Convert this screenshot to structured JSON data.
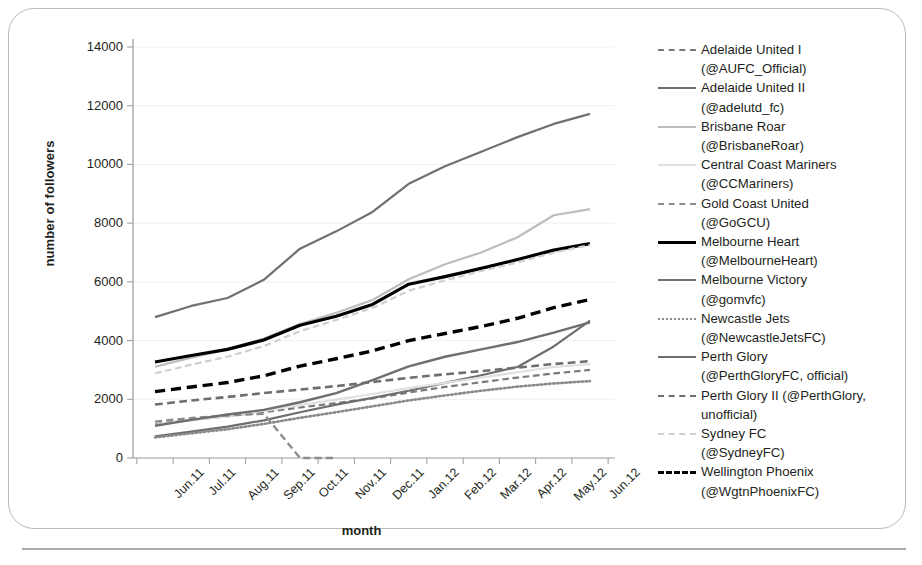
{
  "axes": {
    "ylabel": "number of followers",
    "xlabel": "month",
    "yticks": [
      "0",
      "2000",
      "4000",
      "6000",
      "8000",
      "10000",
      "12000",
      "14000"
    ],
    "xticks": [
      "Jun.11",
      "Jul.11",
      "Aug.11",
      "Sep.11",
      "Oct.11",
      "Nov.11",
      "Dec.11",
      "Jan.12",
      "Feb.12",
      "Mar.12",
      "Apr.12",
      "May.12",
      "Jun.12"
    ]
  },
  "legend": {
    "items": [
      {
        "name": "Adelaide United I",
        "handle": "(@AUFC_Official)",
        "color": "#7a7a7a",
        "dash": "dashed",
        "width": 2.2
      },
      {
        "name": "Adelaide United II",
        "handle": "(@adelutd_fc)",
        "color": "#6e6e6e",
        "dash": "solid",
        "width": 2.2
      },
      {
        "name": "Brisbane Roar",
        "handle": "(@BrisbaneRoar)",
        "color": "#bdbdbd",
        "dash": "solid",
        "width": 2.2
      },
      {
        "name": "Central Coast Mariners",
        "handle": "(@CCMariners)",
        "color": "#e0e0e0",
        "dash": "solid",
        "width": 2.2
      },
      {
        "name": "Gold Coast United",
        "handle": "(@GoGCU)",
        "color": "#8c8c8c",
        "dash": "dashed",
        "width": 2.4
      },
      {
        "name": "Melbourne Heart",
        "handle": "(@MelbourneHeart)",
        "color": "#000000",
        "dash": "solid",
        "width": 3.2
      },
      {
        "name": "Melbourne Victory",
        "handle": "(@gomvfc)",
        "color": "#707070",
        "dash": "solid",
        "width": 2.2
      },
      {
        "name": "Newcastle Jets",
        "handle": "(@NewcastleJetsFC)",
        "color": "#8a8a8a",
        "dash": "dotted",
        "width": 2.6
      },
      {
        "name": "Perth Glory",
        "handle": "(@PerthGloryFC, official)",
        "color": "#6e6e6e",
        "dash": "solid",
        "width": 2.4
      },
      {
        "name": "Perth Glory II (@PerthGlory,",
        "handle": "unofficial)",
        "color": "#6e6e6e",
        "dash": "dashed",
        "width": 2.6
      },
      {
        "name": "Sydney FC",
        "handle": "(@SydneyFC)",
        "color": "#cfcfcf",
        "dash": "dashed",
        "width": 2.2
      },
      {
        "name": "Wellington Phoenix",
        "handle": "(@WgtnPhoenixFC)",
        "color": "#000000",
        "dash": "dashed",
        "width": 3.4
      }
    ]
  },
  "chart_data": {
    "type": "line",
    "title": "",
    "xlabel": "month",
    "ylabel": "number of followers",
    "ylim": [
      0,
      14000
    ],
    "ytick_step": 2000,
    "grid": true,
    "legend_position": "right",
    "x": [
      "Jun.11",
      "Jul.11",
      "Aug.11",
      "Sep.11",
      "Oct.11",
      "Nov.11",
      "Dec.11",
      "Jan.12",
      "Feb.12",
      "Mar.12",
      "Apr.12",
      "May.12",
      "Jun.12"
    ],
    "series": [
      {
        "name": "Adelaide United I (@AUFC_Official)",
        "color": "#7a7a7a",
        "dash": "dashed",
        "width": 2.2,
        "values": [
          1150,
          1300,
          1420,
          1560,
          1720,
          1870,
          2030,
          2230,
          2420,
          2580,
          2740,
          2880,
          3000
        ]
      },
      {
        "name": "Adelaide United II (@adelutd_fc)",
        "color": "#6e6e6e",
        "dash": "solid",
        "width": 2.2,
        "values": [
          740,
          900,
          1070,
          1280,
          1560,
          1820,
          2050,
          2290,
          2560,
          2820,
          3100,
          3800,
          4680
        ]
      },
      {
        "name": "Brisbane Roar (@BrisbaneRoar)",
        "color": "#bdbdbd",
        "dash": "solid",
        "width": 2.2,
        "values": [
          3110,
          3420,
          3700,
          4070,
          4560,
          4950,
          5380,
          6090,
          6600,
          7000,
          7520,
          8270,
          8480
        ]
      },
      {
        "name": "Central Coast Mariners (@CCMariners)",
        "color": "#e0e0e0",
        "dash": "solid",
        "width": 2.2,
        "values": [
          1130,
          1290,
          1420,
          1600,
          1800,
          1990,
          2180,
          2380,
          2560,
          2740,
          2920,
          3100,
          3200
        ]
      },
      {
        "name": "Gold Coast United (@GoGCU)",
        "color": "#8c8c8c",
        "dash": "dashed",
        "width": 2.4,
        "values": [
          1240,
          1360,
          1450,
          1510,
          0,
          0,
          null,
          null,
          null,
          null,
          null,
          null,
          null
        ]
      },
      {
        "name": "Melbourne Heart (@MelbourneHeart)",
        "color": "#000000",
        "dash": "solid",
        "width": 3.2,
        "values": [
          3270,
          3490,
          3700,
          4020,
          4520,
          4830,
          5230,
          5920,
          6180,
          6460,
          6760,
          7080,
          7300
        ]
      },
      {
        "name": "Melbourne Victory (@gomvfc)",
        "color": "#707070",
        "dash": "solid",
        "width": 2.2,
        "values": [
          4800,
          5180,
          5450,
          6070,
          7130,
          7720,
          8380,
          9340,
          9940,
          10430,
          10930,
          11380,
          11720
        ]
      },
      {
        "name": "Newcastle Jets (@NewcastleJetsFC)",
        "color": "#8a8a8a",
        "dash": "dotted",
        "width": 2.6,
        "values": [
          700,
          840,
          980,
          1160,
          1370,
          1560,
          1760,
          1960,
          2130,
          2290,
          2430,
          2540,
          2620
        ]
      },
      {
        "name": "Perth Glory (@PerthGloryFC, official)",
        "color": "#6e6e6e",
        "dash": "solid",
        "width": 2.4,
        "values": [
          1100,
          1300,
          1480,
          1640,
          1900,
          2210,
          2650,
          3120,
          3450,
          3700,
          3950,
          4270,
          4620
        ]
      },
      {
        "name": "Perth Glory II (@PerthGlory, unofficial)",
        "color": "#6e6e6e",
        "dash": "dashed",
        "width": 2.6,
        "values": [
          1820,
          1960,
          2080,
          2210,
          2330,
          2450,
          2590,
          2730,
          2850,
          2960,
          3080,
          3200,
          3300
        ]
      },
      {
        "name": "Sydney FC (@SydneyFC)",
        "color": "#cfcfcf",
        "dash": "dashed",
        "width": 2.2,
        "values": [
          2880,
          3180,
          3450,
          3810,
          4320,
          4700,
          5110,
          5700,
          6050,
          6370,
          6660,
          6990,
          7260
        ]
      },
      {
        "name": "Wellington Phoenix (@WgtnPhoenixFC)",
        "color": "#000000",
        "dash": "dashed",
        "width": 3.4,
        "values": [
          2260,
          2420,
          2570,
          2800,
          3130,
          3380,
          3650,
          4000,
          4240,
          4480,
          4760,
          5120,
          5400
        ]
      }
    ]
  }
}
